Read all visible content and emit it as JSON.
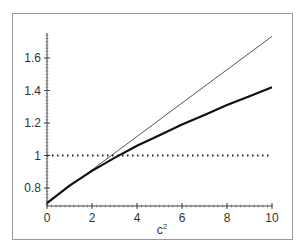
{
  "chart_data": {
    "type": "line",
    "title": "",
    "xlabel": "c²",
    "ylabel": "",
    "xlim": [
      0,
      10
    ],
    "ylim": [
      0.7,
      1.75
    ],
    "grid": false,
    "legend": null,
    "x_ticks": [
      "0",
      "2",
      "4",
      "6",
      "8",
      "10"
    ],
    "y_ticks": [
      "0.8",
      "1",
      "1.2",
      "1.4",
      "1.6"
    ],
    "series": [
      {
        "name": "thin-linear",
        "style": "thin solid",
        "x": [
          0,
          2,
          4,
          6,
          8,
          10
        ],
        "values": [
          0.707,
          0.912,
          1.117,
          1.323,
          1.528,
          1.733
        ]
      },
      {
        "name": "thick-curve",
        "style": "thick solid",
        "x": [
          0,
          1,
          2,
          3,
          4,
          5,
          6,
          7,
          8,
          9,
          10
        ],
        "values": [
          0.707,
          0.815,
          0.905,
          0.985,
          1.06,
          1.125,
          1.19,
          1.25,
          1.31,
          1.365,
          1.42
        ]
      },
      {
        "name": "reference-one",
        "style": "dotted",
        "x": [
          0,
          10
        ],
        "values": [
          1,
          1
        ]
      }
    ]
  },
  "axes": {
    "xlabel_base": "c",
    "xlabel_sup": "2"
  }
}
